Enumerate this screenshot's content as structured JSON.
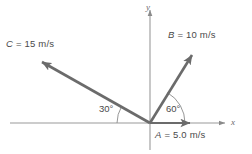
{
  "figure": {
    "type": "vector-diagram",
    "background_color": "#ffffff",
    "stroke_color": "#6b6b6b",
    "text_color": "#4a4a4a",
    "axes": {
      "x_label": "x",
      "y_label": "y",
      "origin": {
        "x": 150,
        "y": 123
      },
      "x_axis": {
        "x1": 10,
        "y1": 123,
        "x2": 222,
        "y2": 123
      },
      "y_axis": {
        "x1": 150,
        "y1": 8,
        "x2": 150,
        "y2": 150
      }
    },
    "vectors": [
      {
        "name": "A",
        "label": "A = 5.0 m/s",
        "symbol": "A",
        "equals": " = ",
        "magnitude": "5.0",
        "units": "m/s",
        "angle_deg": 0,
        "tip": {
          "x": 197,
          "y": 123
        }
      },
      {
        "name": "B",
        "label": "B = 10 m/s",
        "symbol": "B",
        "equals": " = ",
        "magnitude": "10",
        "units": "m/s",
        "angle_deg": 60,
        "tip": {
          "x": 196,
          "y": 50
        }
      },
      {
        "name": "C",
        "label": "C = 15 m/s",
        "symbol": "C",
        "equals": " = ",
        "magnitude": "15",
        "units": "m/s",
        "angle_deg": 150,
        "tip": {
          "x": 35,
          "y": 58
        }
      }
    ],
    "angle_marks": [
      {
        "name": "angle-30",
        "label": "30°",
        "from_axis": "negative-x",
        "value_deg": 30
      },
      {
        "name": "angle-60",
        "label": "60°",
        "from_axis": "positive-x",
        "value_deg": 60
      }
    ]
  }
}
